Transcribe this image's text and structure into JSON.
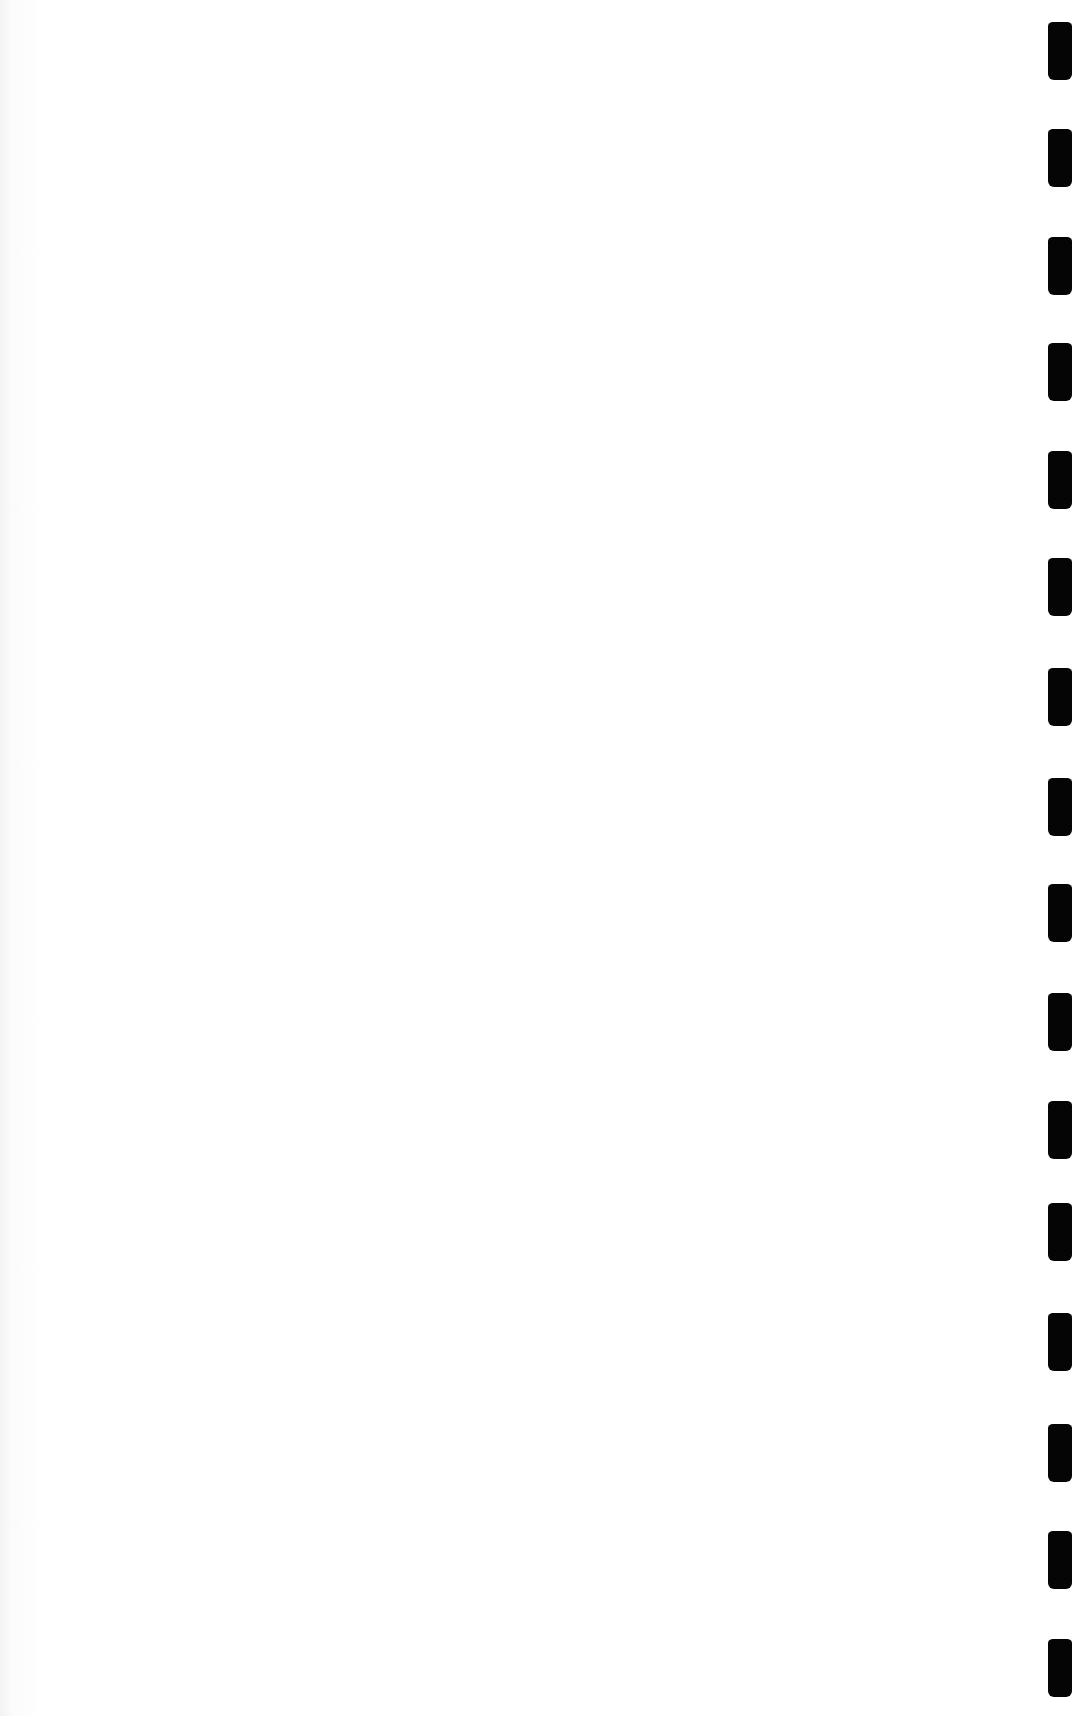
{
  "document": {
    "type": "blank-scanned-page",
    "content_text": "",
    "binding_hole_count": 16
  }
}
